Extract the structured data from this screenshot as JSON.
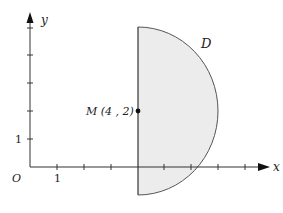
{
  "figure": {
    "axes": {
      "x_label": "x",
      "y_label": "y",
      "origin_label": "O",
      "x_tick_label": "1",
      "y_tick_label": "1"
    },
    "region": {
      "label": "D",
      "description": "half-disk bounded by the line x = 4 on the left and a circular arc of radius 3 centered at M",
      "fill_color": "#ececec",
      "stroke_color": "#555555"
    },
    "point": {
      "label": "M (4 , 2)",
      "x": 4,
      "y": 2
    }
  }
}
